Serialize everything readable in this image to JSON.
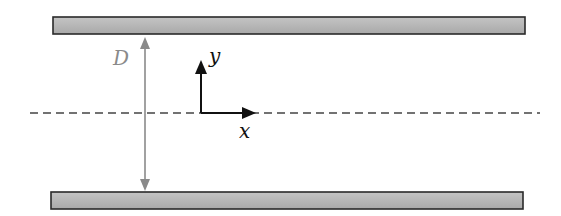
{
  "diagram": {
    "labels": {
      "gap": "D",
      "x_axis": "x",
      "y_axis": "y"
    },
    "colors": {
      "plate_fill": "#b8b8b8",
      "plate_border": "#2a2a2a",
      "dimension": "#8a8a8a",
      "axis": "#111111",
      "centerline": "#444444"
    },
    "elements": {
      "top_plate": {
        "x": 53,
        "y": 17,
        "width": 472,
        "height": 17
      },
      "bottom_plate": {
        "x": 51,
        "y": 192,
        "width": 472,
        "height": 17
      },
      "centerline": {
        "y": 113,
        "x1": 30,
        "x2": 540
      },
      "gap_arrow": {
        "x": 145,
        "y1": 38,
        "y2": 190
      },
      "origin": {
        "x": 201,
        "y": 113
      }
    }
  }
}
